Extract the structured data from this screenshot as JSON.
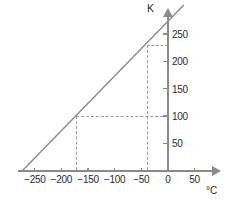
{
  "chart_data": {
    "type": "line",
    "title": "",
    "subtitle": "",
    "xlabel": "°C",
    "ylabel": "K",
    "xlim": [
      -273,
      75
    ],
    "ylim": [
      0,
      280
    ],
    "grid": false,
    "legend": null,
    "x_ticks": [
      -250,
      -200,
      -150,
      -100,
      -50,
      0,
      50
    ],
    "x_tick_labels": [
      "−250",
      "−200",
      "−150",
      "−100",
      "−50",
      "0",
      "50"
    ],
    "y_ticks": [
      50,
      100,
      150,
      200,
      250
    ],
    "y_tick_labels": [
      "50",
      "100",
      "150",
      "200",
      "250"
    ],
    "series": [
      {
        "name": "Celsius to Kelvin",
        "x": [
          -273,
          30
        ],
        "values": [
          0,
          303
        ]
      }
    ],
    "annotations": [
      {
        "name": "guide-point-low",
        "x": -173,
        "y": 100
      },
      {
        "name": "guide-point-high",
        "x": -40,
        "y": 230
      }
    ]
  },
  "axis": {
    "y_title": "K",
    "x_title": "°C"
  }
}
